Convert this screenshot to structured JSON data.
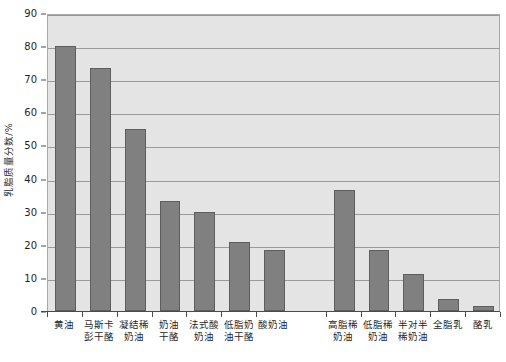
{
  "chart_data": {
    "type": "bar",
    "title": "",
    "xlabel": "",
    "ylabel": "乳脂质量分数/%",
    "ylim": [
      0,
      90
    ],
    "ytick_step": 10,
    "yticks": [
      0,
      10,
      20,
      30,
      40,
      50,
      60,
      70,
      80,
      90
    ],
    "ytick_labels": [
      "0",
      "10",
      "20",
      "30",
      "40",
      "50",
      "60",
      "70",
      "80",
      "90"
    ],
    "grid": true,
    "legend": "none",
    "categories": [
      "黄油",
      "马斯卡彭干酪",
      "凝结稀奶油",
      "奶油干酪",
      "法式酸奶油",
      "低脂奶油干酪",
      "酸奶油",
      "高脂稀奶油",
      "低脂稀奶油",
      "半对半稀奶油",
      "全脂乳",
      "酪乳"
    ],
    "category_lines": [
      [
        "黄油"
      ],
      [
        "马斯卡",
        "彭干酪"
      ],
      [
        "凝结稀",
        "奶油"
      ],
      [
        "奶油",
        "干酪"
      ],
      [
        "法式酸",
        "奶油"
      ],
      [
        "低脂奶",
        "油干酪"
      ],
      [
        "酸奶油"
      ],
      [
        "高脂稀",
        "奶油"
      ],
      [
        "低脂稀",
        "奶油"
      ],
      [
        "半对半",
        "稀奶油"
      ],
      [
        "全脂乳"
      ],
      [
        "酪乳"
      ]
    ],
    "values": [
      80,
      73.5,
      55,
      33.3,
      30,
      20.8,
      18.3,
      36.5,
      18.3,
      11.3,
      3.5,
      1.5
    ],
    "slot_indices": [
      0,
      1,
      2,
      3,
      4,
      5,
      6,
      8,
      9,
      10,
      11,
      12
    ],
    "slot_count": 13,
    "colors": {
      "bar_fill": "#808080",
      "bar_edge": "#5e5e5e",
      "plot_background": "#e4e4e4",
      "gridline": "#9a9a9a",
      "axis": "#4a4a4a",
      "page_background": "#ffffff",
      "text": "#1f1f1f"
    }
  }
}
